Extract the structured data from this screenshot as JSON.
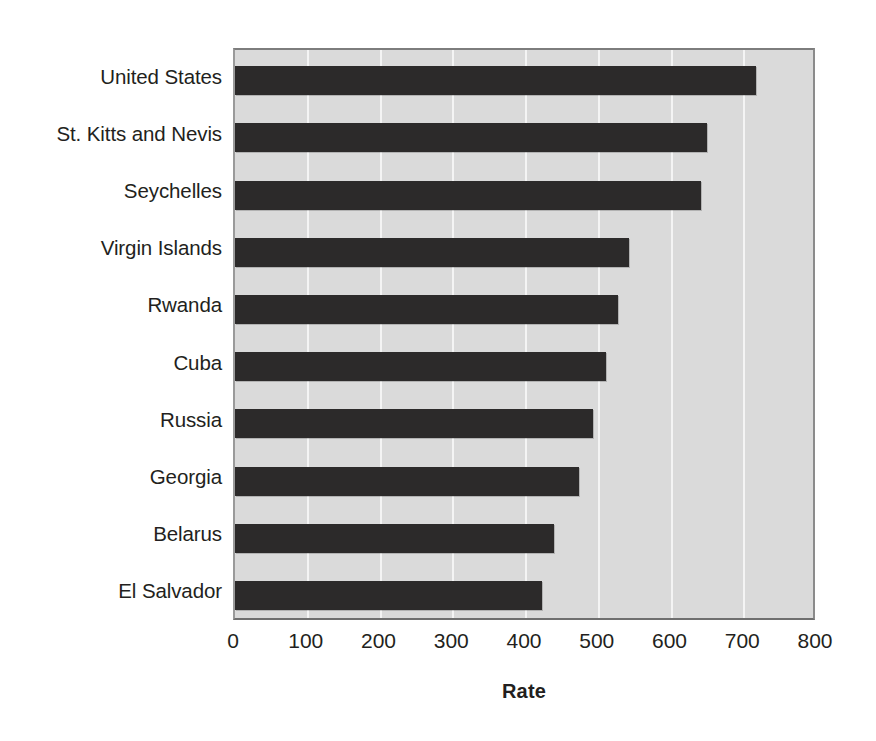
{
  "chart_data": {
    "type": "bar",
    "orientation": "horizontal",
    "title": "",
    "subtitle": "",
    "xlabel": "Rate",
    "ylabel": "",
    "xlim": [
      0,
      800
    ],
    "xticks": [
      0,
      100,
      200,
      300,
      400,
      500,
      600,
      700,
      800
    ],
    "xtick_labels": [
      "0",
      "100",
      "200",
      "300",
      "400",
      "500",
      "600",
      "700",
      "800"
    ],
    "grid": true,
    "grid_axis": "x",
    "legend": false,
    "legend_position": "none",
    "categories": [
      "United States",
      "St. Kitts and Nevis",
      "Seychelles",
      "Virgin Islands",
      "Rwanda",
      "Cuba",
      "Russia",
      "Georgia",
      "Belarus",
      "El Salvador"
    ],
    "values": [
      716,
      649,
      641,
      542,
      527,
      510,
      492,
      473,
      438,
      422
    ],
    "bar_color": "#2c2a2a",
    "plot_background": "#dadada",
    "gridline_color": "#f4f4f4",
    "figure_background": "#ffffff",
    "text_color": "#231f20"
  },
  "axis": {
    "x_title": "Rate"
  }
}
